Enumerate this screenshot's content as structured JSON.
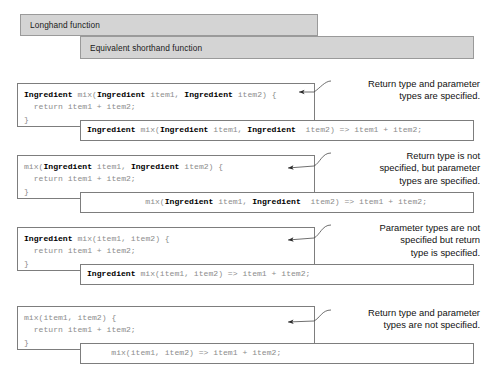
{
  "figure": {
    "banners": [
      {
        "id": "longhand",
        "label": "Longhand function"
      },
      {
        "id": "shorthand",
        "label": "Equivalent shorthand function"
      }
    ],
    "rows": [
      {
        "longhand": {
          "line1_pre": "Ingredient",
          "line1_mid": " mix(",
          "line1_t1": "Ingredient",
          "line1_p1": " item1, ",
          "line1_t2": "Ingredient",
          "line1_p2": " item2) {",
          "line2": "  return item1 + item2;",
          "line3": "}"
        },
        "shorthand": {
          "indent": "",
          "pre": "Ingredient",
          "mid": " mix(",
          "t1": "Ingredient",
          "p1": " item1, ",
          "t2": "Ingredient",
          "p2": "  item2) => item1 + item2;"
        },
        "annotation": "Return type and parameter\ntypes are specified."
      },
      {
        "longhand": {
          "line1_pre": "",
          "line1_mid": "mix(",
          "line1_t1": "Ingredient",
          "line1_p1": " item1, ",
          "line1_t2": "Ingredient",
          "line1_p2": " item2) {",
          "line2": "  return item1 + item2;",
          "line3": "}"
        },
        "shorthand": {
          "indent": "            ",
          "pre": "",
          "mid": "mix(",
          "t1": "Ingredient",
          "p1": " item1, ",
          "t2": "Ingredient",
          "p2": "  item2) => item1 + item2;"
        },
        "annotation": "Return type is not\nspecified, but parameter\ntypes are specified."
      },
      {
        "longhand": {
          "line1_pre": "Ingredient",
          "line1_mid": " mix(item1, item2) {",
          "line1_t1": "",
          "line1_p1": "",
          "line1_t2": "",
          "line1_p2": "",
          "line2": "  return item1 + item2;",
          "line3": "}"
        },
        "shorthand": {
          "indent": "",
          "pre": "Ingredient",
          "mid": " mix(item1, item2) => item1 + item2;",
          "t1": "",
          "p1": "",
          "t2": "",
          "p2": ""
        },
        "annotation": "Parameter types are not\nspecified but return\ntype is specified."
      },
      {
        "longhand": {
          "line1_pre": "",
          "line1_mid": "mix(item1, item2) {",
          "line1_t1": "",
          "line1_p1": "",
          "line1_t2": "",
          "line1_p2": "",
          "line2": "  return item1 + item2;",
          "line3": "}"
        },
        "shorthand": {
          "indent": "     ",
          "pre": "",
          "mid": "mix(item1, item2) => item1 + item2;",
          "t1": "",
          "p1": "",
          "t2": "",
          "p2": ""
        },
        "annotation": "Return type and parameter\ntypes are not specified."
      }
    ],
    "colors": {
      "banner_fill": "#d4d4d4",
      "banner_border": "#9a9a9a",
      "box_border": "#7d7d7d",
      "code_plain": "#8c8c8c",
      "code_bold": "#000000",
      "annotation_text": "#111111"
    }
  }
}
